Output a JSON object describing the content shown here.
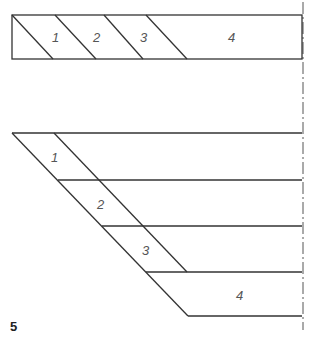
{
  "figure": {
    "number": "5",
    "colors": {
      "line": "#333333",
      "label": "#555555",
      "axis": "#555555"
    }
  },
  "top_diagram": {
    "description": "Rectangle strip divided by parallel diagonal lines into numbered segments",
    "segments": [
      {
        "label": "1"
      },
      {
        "label": "2"
      },
      {
        "label": "3"
      },
      {
        "label": "4"
      }
    ]
  },
  "bottom_diagram": {
    "description": "Stepped parallelogram layers offset diagonally, each numbered",
    "layers": [
      {
        "label": "1"
      },
      {
        "label": "2"
      },
      {
        "label": "3"
      },
      {
        "label": "4"
      }
    ]
  },
  "center_axis": {
    "style": "dash-dot"
  }
}
